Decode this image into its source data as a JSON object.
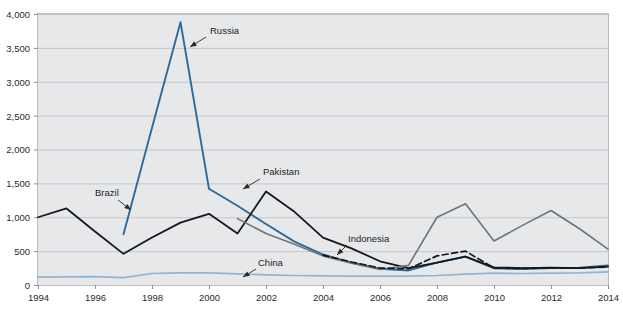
{
  "chart_data": {
    "type": "line",
    "title": "",
    "xlabel": "",
    "ylabel": "",
    "xlim": [
      1994,
      2014
    ],
    "ylim": [
      0,
      4000
    ],
    "grid": true,
    "legend_position": "inline-annotations",
    "x": [
      1994,
      1995,
      1996,
      1997,
      1998,
      1999,
      2000,
      2001,
      2002,
      2003,
      2004,
      2005,
      2006,
      2007,
      2008,
      2009,
      2010,
      2011,
      2012,
      2013,
      2014
    ],
    "y_ticks": [
      "0",
      "500",
      "1,000",
      "1,500",
      "2,000",
      "2,500",
      "3,000",
      "3,500",
      "4,000"
    ],
    "x_ticks": [
      "1994",
      "1996",
      "1998",
      "2000",
      "2002",
      "2004",
      "2006",
      "2008",
      "2010",
      "2012",
      "2014"
    ],
    "series": [
      {
        "name": "Russia",
        "color": "#2b6a9b",
        "style": "solid",
        "width": 1.9,
        "start_year": 1997,
        "values": [
          null,
          null,
          null,
          750,
          2320,
          3880,
          1420,
          1170,
          900,
          640,
          450,
          330,
          240,
          215,
          330,
          420,
          245,
          235,
          250,
          255,
          290
        ]
      },
      {
        "name": "Brazil",
        "color": "#15181c",
        "style": "solid",
        "width": 1.8,
        "start_year": 1994,
        "values": [
          1000,
          1130,
          790,
          460,
          700,
          920,
          1050,
          760,
          1380,
          1080,
          700,
          540,
          350,
          250,
          330,
          420,
          260,
          250,
          255,
          250,
          270
        ]
      },
      {
        "name": "Pakistan",
        "color": "#6f7478",
        "style": "solid",
        "width": 1.6,
        "start_year": 2001,
        "values": [
          null,
          null,
          null,
          null,
          null,
          null,
          null,
          980,
          760,
          600,
          430,
          320,
          230,
          290,
          1000,
          1200,
          650,
          880,
          1100,
          830,
          530
        ]
      },
      {
        "name": "Indonesia",
        "color": "#15181c",
        "style": "dashed",
        "width": 1.7,
        "start_year": 2004,
        "values": [
          null,
          null,
          null,
          null,
          null,
          null,
          null,
          null,
          null,
          null,
          440,
          340,
          250,
          240,
          430,
          500,
          250,
          245,
          250,
          250,
          265
        ]
      },
      {
        "name": "China",
        "color": "#8fb5d4",
        "style": "solid",
        "width": 1.7,
        "start_year": 1994,
        "values": [
          115,
          120,
          125,
          110,
          170,
          180,
          180,
          165,
          150,
          140,
          135,
          130,
          130,
          130,
          140,
          160,
          175,
          170,
          175,
          180,
          195
        ]
      }
    ],
    "annotations": [
      {
        "label": "Russia",
        "label_x": 210,
        "label_y": 34,
        "leader": [
          [
            206,
            37
          ],
          [
            190,
            47
          ]
        ]
      },
      {
        "label": "Brazil",
        "label_x": 95,
        "label_y": 196,
        "leader": [
          [
            118,
            200
          ],
          [
            131,
            210
          ]
        ]
      },
      {
        "label": "Pakistan",
        "label_x": 263,
        "label_y": 175,
        "leader": [
          [
            260,
            179
          ],
          [
            243,
            189
          ]
        ]
      },
      {
        "label": "Indonesia",
        "label_x": 348,
        "label_y": 242,
        "leader": [
          [
            347,
            245
          ],
          [
            337,
            255
          ]
        ]
      },
      {
        "label": "China",
        "label_x": 258,
        "label_y": 266,
        "leader": [
          [
            256,
            269
          ],
          [
            243,
            277
          ]
        ]
      }
    ]
  }
}
